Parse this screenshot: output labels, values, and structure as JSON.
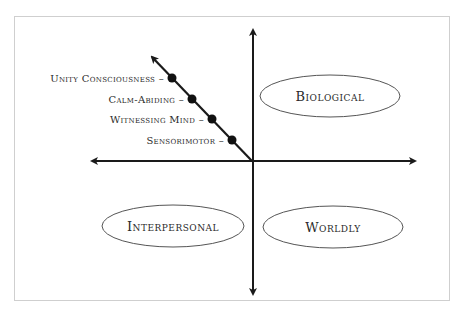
{
  "diagram": {
    "quadrants": {
      "top_right": "Biological",
      "bottom_left": "Interpersonal",
      "bottom_right": "Worldly"
    },
    "diagonal_stages": [
      {
        "label": "Unity Consciousness"
      },
      {
        "label": "Calm-Abiding"
      },
      {
        "label": "Witnessing Mind"
      },
      {
        "label": "Sensorimotor"
      }
    ],
    "colors": {
      "axis": "#1a1a1a",
      "dot": "#111111",
      "ellipse": "#555555",
      "frame": "#cfcfcf"
    }
  }
}
